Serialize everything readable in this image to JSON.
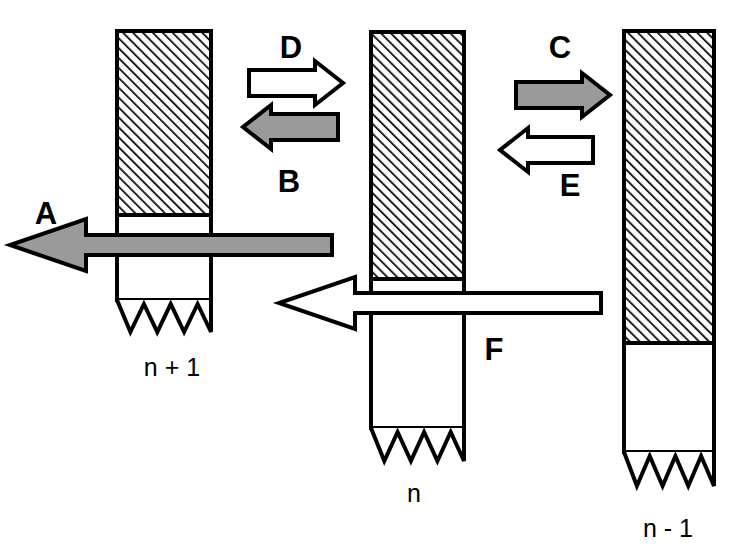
{
  "figure": {
    "title": "",
    "background_color": "#ffffff",
    "stroke_color": "#000000",
    "gray_fill": "#9a9a9a",
    "white_fill": "#ffffff",
    "width": 730,
    "height": 555
  },
  "columns": [
    {
      "id": "column-n-plus-1",
      "label": "n + 1",
      "label_x": 172,
      "label_y": 376,
      "x": 117,
      "width": 94,
      "top": 31,
      "hatched_bottom": 215,
      "body_bottom": 300,
      "jagged_bottom": 332,
      "fill": "hatched"
    },
    {
      "id": "column-n",
      "label": "n",
      "label_x": 414,
      "label_y": 502,
      "x": 371,
      "width": 93,
      "top": 32,
      "hatched_bottom": 279,
      "body_bottom": 428,
      "jagged_bottom": 461,
      "fill": "hatched"
    },
    {
      "id": "column-n-minus-1",
      "label": "n - 1",
      "label_x": 668,
      "label_y": 537,
      "x": 624,
      "width": 90,
      "top": 31,
      "hatched_bottom": 343,
      "body_bottom": 452,
      "jagged_bottom": 486,
      "fill": "hatched"
    }
  ],
  "arrows": [
    {
      "id": "arrow-d",
      "label": "D",
      "label_x": 291,
      "label_y": 58,
      "direction": "right",
      "fill": "white",
      "x1": 249,
      "x2": 343,
      "cy": 83,
      "shaft_half": 13,
      "head_half": 22,
      "head_len": 28
    },
    {
      "id": "arrow-b",
      "label": "B",
      "label_x": 289,
      "label_y": 192,
      "direction": "left",
      "fill": "gray",
      "x1": 243,
      "x2": 338,
      "cy": 127,
      "shaft_half": 13,
      "head_half": 22,
      "head_len": 28
    },
    {
      "id": "arrow-c",
      "label": "C",
      "label_x": 560,
      "label_y": 58,
      "direction": "right",
      "fill": "gray",
      "x2": 610,
      "x1": 516,
      "cy": 95,
      "shaft_half": 13,
      "head_half": 22,
      "head_len": 28
    },
    {
      "id": "arrow-e",
      "label": "E",
      "label_x": 570,
      "label_y": 196,
      "direction": "left",
      "fill": "white",
      "x1": 500,
      "x2": 593,
      "cy": 150,
      "shaft_half": 13,
      "head_half": 22,
      "head_len": 28
    },
    {
      "id": "arrow-a",
      "label": "A",
      "label_x": 46,
      "label_y": 224,
      "direction": "left",
      "fill": "gray",
      "x1": 10,
      "x2": 332,
      "cy": 245,
      "shaft_half": 10,
      "head_half": 26,
      "head_len": 76
    },
    {
      "id": "arrow-f",
      "label": "F",
      "label_x": 494,
      "label_y": 360,
      "direction": "left",
      "fill": "white",
      "x1": 279,
      "x2": 601,
      "cy": 303,
      "shaft_half": 10,
      "head_half": 26,
      "head_len": 76
    }
  ]
}
